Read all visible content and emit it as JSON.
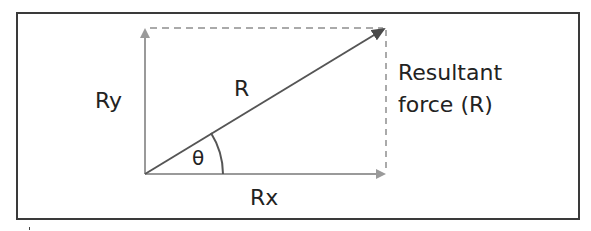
{
  "diagram": {
    "labels": {
      "vertical_component": "Ry",
      "resultant": "R",
      "angle": "θ",
      "horizontal_component": "Rx",
      "resultant_caption_line1": "Resultant",
      "resultant_caption_line2": "force (R)"
    },
    "colors": {
      "frame": "#3a3a3a",
      "resultant_vector": "#555555",
      "component_vectors": "#9a9a9a",
      "dashed_lines": "#aaaaaa",
      "angle_arc": "#555555",
      "text": "#222222"
    },
    "geometry": {
      "origin": [
        145,
        174
      ],
      "vertical_tip": [
        145,
        28
      ],
      "horizontal_tip": [
        385,
        174
      ],
      "resultant_tip": [
        385,
        28
      ],
      "arc_radius": 78
    }
  }
}
